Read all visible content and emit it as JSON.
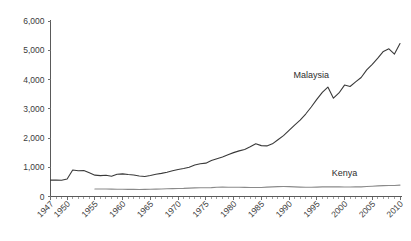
{
  "chart_data": {
    "type": "line",
    "title": "",
    "subtitle": "",
    "xlabel": "",
    "ylabel": "",
    "grid": false,
    "legend_position": "inline-labels",
    "ylim": [
      0,
      6000
    ],
    "xlim": [
      1947,
      2010
    ],
    "ytick_labels": [
      "6,000",
      "5,000",
      "4,000",
      "3,000",
      "2,000",
      "1,000",
      "0"
    ],
    "ytick_values": [
      6000,
      5000,
      4000,
      3000,
      2000,
      1000,
      0
    ],
    "xtick_labels": [
      "1947",
      "1950",
      "1955",
      "1960",
      "1965",
      "1970",
      "1975",
      "1980",
      "1985",
      "1990",
      "1995",
      "2000",
      "2005",
      "2010"
    ],
    "xtick_values": [
      1947,
      1950,
      1955,
      1960,
      1965,
      1970,
      1975,
      1980,
      1985,
      1990,
      1995,
      2000,
      2005,
      2010
    ],
    "x": [
      1947,
      1948,
      1949,
      1950,
      1951,
      1952,
      1953,
      1954,
      1955,
      1956,
      1957,
      1958,
      1959,
      1960,
      1961,
      1962,
      1963,
      1964,
      1965,
      1966,
      1967,
      1968,
      1969,
      1970,
      1971,
      1972,
      1973,
      1974,
      1975,
      1976,
      1977,
      1978,
      1979,
      1980,
      1981,
      1982,
      1983,
      1984,
      1985,
      1986,
      1987,
      1988,
      1989,
      1990,
      1991,
      1992,
      1993,
      1994,
      1995,
      1996,
      1997,
      1998,
      1999,
      2000,
      2001,
      2002,
      2003,
      2004,
      2005,
      2006,
      2007,
      2008,
      2009,
      2010
    ],
    "series": [
      {
        "name": "Malaysia",
        "color": "#3a3a3a",
        "values": [
          560,
          560,
          555,
          600,
          905,
          880,
          890,
          810,
          730,
          715,
          725,
          690,
          760,
          775,
          750,
          735,
          700,
          685,
          720,
          760,
          790,
          830,
          880,
          925,
          955,
          1000,
          1075,
          1120,
          1140,
          1230,
          1290,
          1350,
          1430,
          1500,
          1560,
          1610,
          1700,
          1800,
          1740,
          1730,
          1800,
          1940,
          2080,
          2260,
          2440,
          2610,
          2820,
          3060,
          3320,
          3560,
          3740,
          3360,
          3540,
          3810,
          3760,
          3920,
          4070,
          4330,
          4520,
          4730,
          4960,
          5050,
          4870,
          5230
        ],
        "label_x": 1994,
        "label_y": 4050
      },
      {
        "name": "Kenya",
        "color": "#8a8a8a",
        "values": [
          null,
          null,
          null,
          null,
          null,
          null,
          null,
          null,
          255,
          258,
          256,
          252,
          250,
          248,
          245,
          243,
          240,
          242,
          246,
          252,
          258,
          264,
          270,
          275,
          278,
          286,
          296,
          300,
          298,
          302,
          318,
          322,
          318,
          318,
          314,
          312,
          308,
          306,
          310,
          320,
          330,
          338,
          340,
          338,
          330,
          322,
          318,
          316,
          322,
          328,
          330,
          330,
          328,
          324,
          326,
          328,
          330,
          340,
          352,
          362,
          372,
          378,
          378,
          388
        ],
        "label_x": 2000,
        "label_y": 700
      }
    ]
  }
}
